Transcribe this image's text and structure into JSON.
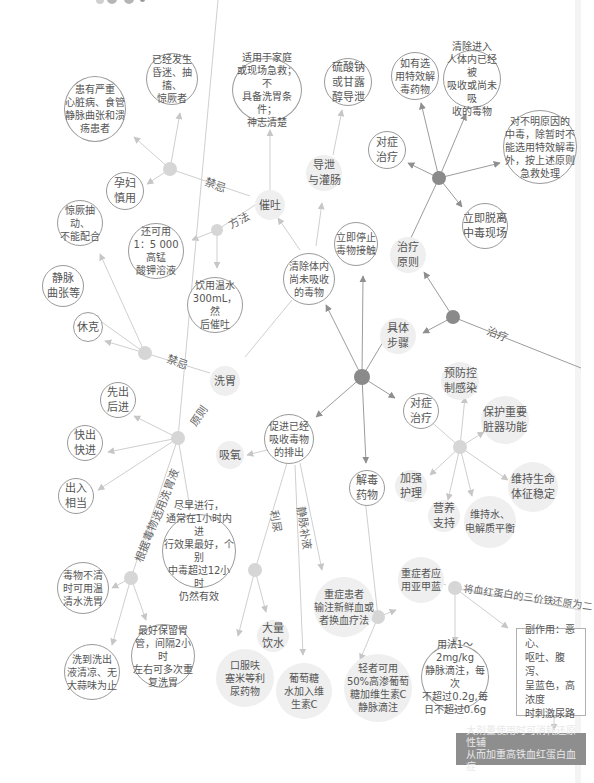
{
  "diagram": {
    "type": "mind-map",
    "topic": "中毒急救",
    "colors": {
      "hub_dark": "#8a8a8a",
      "hub_light": "#cfcfcf",
      "edge": "#bdbdbd",
      "edge_dark": "#8f8f8f",
      "dark_box": "#8e8e8e"
    },
    "edge_labels": {
      "jinji_top": "禁忌",
      "fangfa": "方法",
      "jinji_wash": "禁忌",
      "yuanze": "原则",
      "genju": "根据毒物选用洗胃液",
      "zhiliao": "治疗",
      "liniao": "利尿",
      "jingmai": "静脉补液",
      "methylene_reduce": "将血红蛋白的三价铁还原为二"
    },
    "nodes": {
      "yijing_fasheng": "已经发生\n昏迷、抽搐、\n惊厥者",
      "huanyou_yanzhong": "患有严重\n心脏病、食管\n静脉曲张和溃\n疡患者",
      "yunfu": "孕妇\n慎用",
      "shiyong_jiating": "适用于家庭\n或现场急救；不\n具备洗胃条件；\n神志清楚",
      "liusuanna": "硫酸钠\n或甘露\n醇导泄",
      "ruyou_texiao": "如有选\n用特效解\n毒药物",
      "qingchu_jinru": "清除进入\n人体内已经被\n吸收或尚未吸\n收的毒物",
      "duibuming": "对不明原因的\n中毒，除暂时不\n能选用特效解毒\n外，按上述原则\n急救处理",
      "duizheng_top": "对症\n治疗",
      "lijituoli": "立即脱离\n中毒现场",
      "zhiliao_yuanze": "治疗\n原则",
      "cuitu": "催吐",
      "daoxie": "导泄\n与灌肠",
      "huankeyong": "还可用\n1：5 000高锰\n酸钾溶液",
      "jingjue_chouchu": "惊厥抽动、\n不能配合",
      "yinyong_wenshui": "饮用温水\n300mL，然\n后催吐",
      "qingchu_tinei": "清除体内\n尚未吸收\n的毒物",
      "liji_tingzhi": "立即停止\n毒物接触",
      "jingmai_quzhang": "静脉\n曲张等",
      "xiuke": "休克",
      "juti_buzhou": "具体\n步骤",
      "xiwei": "洗胃",
      "xianchu": "先出\n后进",
      "kuaichu": "快出\n快进",
      "churu": "出入\n相当",
      "cujin": "促进已经\n吸收毒物\n的排出",
      "xiyang": "吸氧",
      "jiedu_yaowu": "解毒\n药物",
      "yufang": "预防控\n制感染",
      "duizheng_mid": "对症\n治疗",
      "baohu": "保护重要\n脏器功能",
      "jiaqiang": "加强\n护理",
      "weichi_sm": "维持生命\n体征稳定",
      "yingyang": "营养\n支持",
      "weichi_shui": "维持水、\n电解质平衡",
      "jinzao": "尽早进行，\n通常在1小时内进\n行效果最好，个别\n中毒超过12小时\n仍然有效",
      "duwu_buqing": "毒物不清\n时可用温\n清水洗胃",
      "xidao": "洗到洗出\n液清凉、无\n大蒜味为止",
      "zuihao_baoliu": "最好保留胃\n管，间隔2小时\n左右可多次重\n复洗胃",
      "dali_yinshui": "大量\n饮水",
      "koufu": "口服呋\n塞米等利\n尿药物",
      "putaotang": "葡萄糖\n水加入维\n生素C",
      "zhongzheng_huanzhe": "重症患者\n输注新鲜血或\n者换血疗法",
      "qingzhe": "轻者可用\n50%高渗葡萄\n糖加维生素C\n静脉滴注",
      "zhongzheng_yajialan": "重症者应\n用亚甲蓝",
      "yongfa": "用法1～2mg/kg\n静脉滴注，每次\n不超过0.2g,每\n日不超过0.6g",
      "fuzuoyong": "副作用：恶心、\n呕吐、腹泻、\n呈蓝色，高浓度\n时刺激尿路",
      "daliang_shiyong": "大剂量使用时可消耗还原性辅\n从而加重高铁血红蛋白血症"
    }
  }
}
